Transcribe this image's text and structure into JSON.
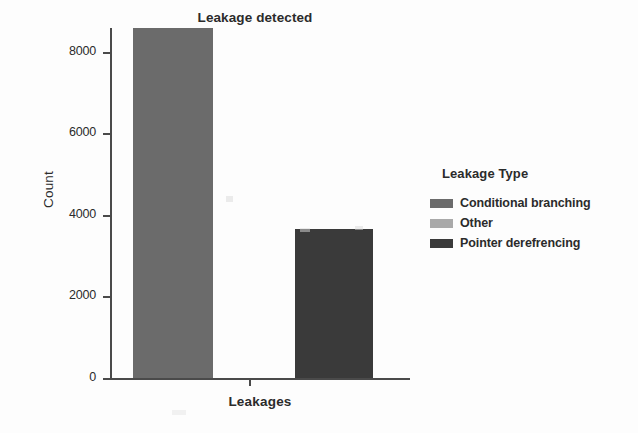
{
  "chart_data": {
    "type": "bar",
    "title": "Leakage detected",
    "xlabel": "Leakages",
    "ylabel": "Count",
    "categories": [
      "Conditional branching",
      "Other",
      "Pointer derefrencing"
    ],
    "values": [
      8600,
      0,
      3650
    ],
    "ylim": [
      0,
      8800
    ],
    "yticks": [
      0,
      2000,
      4000,
      6000,
      8000
    ],
    "ytick_labels": [
      "0",
      "2000",
      "4000",
      "6000",
      "8000"
    ],
    "grid": false,
    "legend_position": "right",
    "legend_title": "Leakage Type",
    "series": [
      {
        "name": "Conditional branching",
        "value": 8600,
        "color": "#6b6b6b"
      },
      {
        "name": "Other",
        "value": 0,
        "color": "#a9a9a9"
      },
      {
        "name": "Pointer derefrencing",
        "value": 3650,
        "color": "#3a3a3a"
      }
    ]
  },
  "axes": {
    "y_title": "Count",
    "x_title": "Leakages",
    "ticks": [
      {
        "label": "8000",
        "value": 8000
      },
      {
        "label": "6000",
        "value": 6000
      },
      {
        "label": "4000",
        "value": 4000
      },
      {
        "label": "2000",
        "value": 2000
      },
      {
        "label": "0",
        "value": 0
      }
    ]
  },
  "legend": {
    "title": "Leakage Type",
    "items": [
      {
        "label": "Conditional branching",
        "color": "#6b6b6b"
      },
      {
        "label": "Other",
        "color": "#a9a9a9"
      },
      {
        "label": "Pointer derefrencing",
        "color": "#3a3a3a"
      }
    ]
  },
  "colors": {
    "background": "#fdfdfd",
    "axis": "#4a4a4a",
    "text": "#2b2b2b",
    "bar_conditional": "#6b6b6b",
    "bar_other": "#a9a9a9",
    "bar_pointer": "#3a3a3a"
  }
}
